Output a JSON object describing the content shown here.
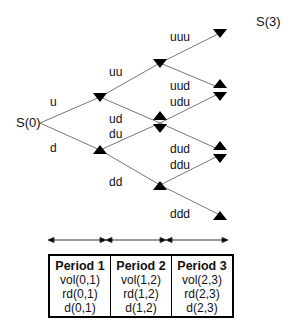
{
  "tree": {
    "root_label": "S(0)",
    "terminal_label": "S(3)",
    "branch_labels": {
      "u": "u",
      "d": "d",
      "uu": "uu",
      "ud": "ud",
      "du": "du",
      "dd": "dd",
      "uuu": "uuu",
      "uud": "uud",
      "udu": "udu",
      "dud": "dud",
      "ddu": "ddu",
      "ddd": "ddd"
    }
  },
  "periods": [
    {
      "title": "Period 1",
      "vol": "vol(0,1)",
      "rd": "rd(0,1)",
      "d": "d(0,1)"
    },
    {
      "title": "Period 2",
      "vol": "vol(1,2)",
      "rd": "rd(1,2)",
      "d": "d(1,2)"
    },
    {
      "title": "Period 3",
      "vol": "vol(2,3)",
      "rd": "rd(2,3)",
      "d": "d(2,3)"
    }
  ]
}
